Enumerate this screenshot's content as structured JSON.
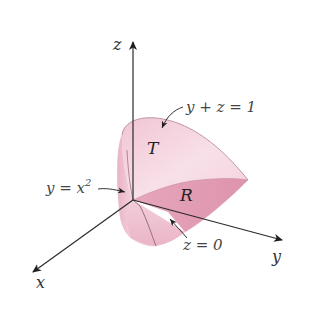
{
  "figure": {
    "axes": {
      "x_label": "x",
      "y_label": "y",
      "z_label": "z"
    },
    "regions": {
      "top_surface": "T",
      "base_region": "R"
    },
    "annotations": {
      "plane": "y + z = 1",
      "parabolic_cylinder": "y = x",
      "parabolic_exponent": "2",
      "base_plane": "z = 0"
    },
    "colors": {
      "solid_light": "#f6d6e0",
      "solid_mid": "#eeb9c9",
      "base_dark": "#e29bb2",
      "edge": "#a8788a",
      "axis": "#2b2b2b"
    }
  }
}
